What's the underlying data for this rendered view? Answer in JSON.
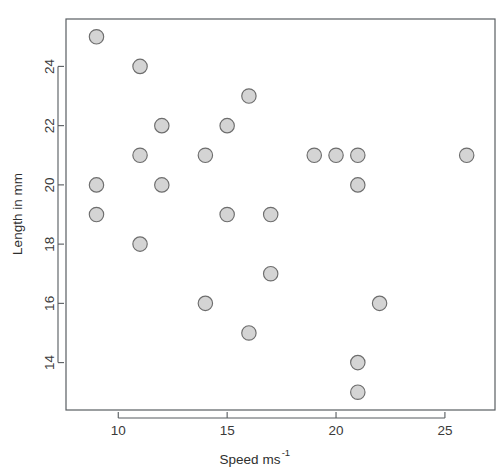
{
  "chart_data": {
    "type": "scatter",
    "title": "",
    "xlabel": "Speed ms",
    "xlabel_exponent": "-1",
    "xlabel_full": "Speed ms⁻¹",
    "ylabel": "Length in mm",
    "xlim": [
      7.6,
      27.3
    ],
    "ylim": [
      12.4,
      25.6
    ],
    "xticks": [
      10,
      15,
      20,
      25
    ],
    "xtick_labels": [
      "10",
      "15",
      "20",
      "25"
    ],
    "yticks": [
      14,
      16,
      18,
      20,
      22,
      24
    ],
    "ytick_labels": [
      "14",
      "16",
      "18",
      "20",
      "22",
      "24"
    ],
    "grid": false,
    "legend": null,
    "marker": {
      "shape": "circle",
      "fill_color": "#d4d4d4",
      "edge_color": "#6d6d6d",
      "radius_px": 7.2
    },
    "points": [
      {
        "x": 9,
        "y": 25
      },
      {
        "x": 11,
        "y": 24
      },
      {
        "x": 16,
        "y": 23
      },
      {
        "x": 12,
        "y": 22
      },
      {
        "x": 15,
        "y": 22
      },
      {
        "x": 11,
        "y": 21
      },
      {
        "x": 14,
        "y": 21
      },
      {
        "x": 19,
        "y": 21
      },
      {
        "x": 20,
        "y": 21
      },
      {
        "x": 21,
        "y": 21
      },
      {
        "x": 26,
        "y": 21
      },
      {
        "x": 9,
        "y": 20
      },
      {
        "x": 12,
        "y": 20
      },
      {
        "x": 21,
        "y": 20
      },
      {
        "x": 9,
        "y": 19
      },
      {
        "x": 15,
        "y": 19
      },
      {
        "x": 17,
        "y": 19
      },
      {
        "x": 11,
        "y": 18
      },
      {
        "x": 17,
        "y": 17
      },
      {
        "x": 14,
        "y": 16
      },
      {
        "x": 22,
        "y": 16
      },
      {
        "x": 16,
        "y": 15
      },
      {
        "x": 21,
        "y": 14
      },
      {
        "x": 21,
        "y": 13
      }
    ],
    "n_points": 24
  },
  "colors": {
    "background": "#ffffff",
    "axis": "#555a5e",
    "box": "#595e62",
    "text": "#2e2e2e",
    "marker_fill": "#d4d4d4",
    "marker_edge": "#6d6d6d"
  },
  "geometry": {
    "plot_left": 66,
    "plot_right": 495,
    "plot_top": 19,
    "plot_bottom": 410
  }
}
